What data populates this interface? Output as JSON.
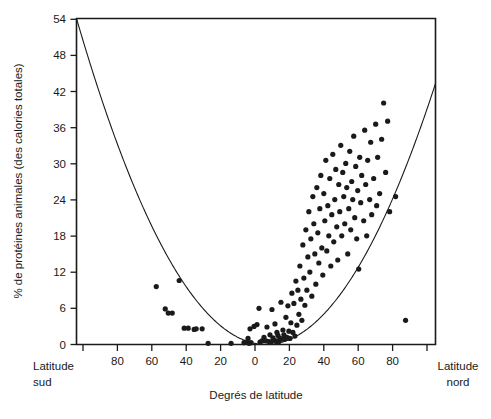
{
  "chart_data": {
    "type": "scatter",
    "title": "",
    "xlabel": "Degrés de latitude",
    "ylabel": "% de protéines animales (des calories totales)",
    "xlim": [
      -90,
      90
    ],
    "ylim": [
      0,
      54
    ],
    "grid": false,
    "legend": null,
    "x_axis": {
      "label": "Degrés de latitude",
      "tick_values": [
        -90,
        -80,
        -60,
        -40,
        -20,
        0,
        20,
        40,
        60,
        80,
        90
      ],
      "tick_labels": [
        "",
        "80",
        "60",
        "40",
        "20",
        "0",
        "20",
        "40",
        "60",
        "80",
        ""
      ],
      "left_corner_label_line1": "Latitude",
      "left_corner_label_line2": "sud",
      "right_corner_label_line1": "Latitude",
      "right_corner_label_line2": "nord",
      "note": "negative x = latitude sud, positive x = latitude nord"
    },
    "y_axis": {
      "label": "% de protéines animales (des calories totales)",
      "tick_values": [
        0,
        6,
        12,
        18,
        24,
        30,
        36,
        42,
        48,
        54
      ],
      "tick_labels": [
        "0",
        "6",
        "12",
        "18",
        "24",
        "30",
        "36",
        "42",
        "48",
        "54"
      ]
    },
    "series": [
      {
        "name": "pays",
        "marker": "filled-circle",
        "color": "#1a1a1a",
        "points": [
          [
            -50.0,
            9.6
          ],
          [
            -45.5,
            5.9
          ],
          [
            -44.0,
            5.2
          ],
          [
            -42.0,
            5.2
          ],
          [
            -38.5,
            10.6
          ],
          [
            -36.0,
            2.7
          ],
          [
            -34.0,
            2.7
          ],
          [
            -31.0,
            2.5
          ],
          [
            -30.0,
            2.6
          ],
          [
            -27.0,
            2.6
          ],
          [
            -24.0,
            0.2
          ],
          [
            -12.5,
            0.2
          ],
          [
            -6.0,
            0.3
          ],
          [
            -4.5,
            0.4
          ],
          [
            -4.0,
            1.0
          ],
          [
            -3.5,
            0.2
          ],
          [
            -3.0,
            2.6
          ],
          [
            -2.5,
            0.3
          ],
          [
            -1.0,
            3.0
          ],
          [
            0.5,
            3.3
          ],
          [
            1.5,
            6.0
          ],
          [
            2.0,
            0.4
          ],
          [
            3.0,
            0.6
          ],
          [
            4.0,
            1.2
          ],
          [
            5.0,
            0.6
          ],
          [
            5.5,
            2.9
          ],
          [
            6.5,
            0.5
          ],
          [
            7.0,
            1.6
          ],
          [
            7.5,
            0.4
          ],
          [
            8.0,
            5.8
          ],
          [
            8.5,
            1.1
          ],
          [
            9.0,
            0.7
          ],
          [
            9.5,
            3.4
          ],
          [
            10.0,
            0.6
          ],
          [
            10.5,
            2.0
          ],
          [
            11.0,
            1.5
          ],
          [
            11.5,
            0.5
          ],
          [
            12.0,
            1.0
          ],
          [
            12.5,
            7.0
          ],
          [
            13.0,
            0.9
          ],
          [
            13.5,
            2.4
          ],
          [
            14.0,
            1.6
          ],
          [
            14.5,
            0.9
          ],
          [
            15.0,
            4.5
          ],
          [
            15.5,
            1.2
          ],
          [
            16.0,
            6.4
          ],
          [
            16.5,
            2.2
          ],
          [
            17.0,
            1.0
          ],
          [
            17.5,
            3.6
          ],
          [
            18.0,
            8.5
          ],
          [
            18.5,
            2.0
          ],
          [
            19.0,
            6.8
          ],
          [
            19.5,
            1.4
          ],
          [
            20.0,
            10.5
          ],
          [
            20.5,
            3.2
          ],
          [
            21.0,
            9.0
          ],
          [
            21.5,
            5.0
          ],
          [
            22.0,
            13.0
          ],
          [
            22.5,
            7.5
          ],
          [
            23.0,
            4.0
          ],
          [
            23.5,
            16.5
          ],
          [
            24.0,
            11.0
          ],
          [
            24.5,
            6.5
          ],
          [
            25.0,
            19.0
          ],
          [
            25.5,
            9.0
          ],
          [
            26.0,
            14.5
          ],
          [
            26.5,
            22.0
          ],
          [
            27.0,
            12.0
          ],
          [
            27.5,
            17.5
          ],
          [
            28.0,
            8.0
          ],
          [
            28.5,
            24.5
          ],
          [
            29.0,
            20.0
          ],
          [
            29.5,
            15.0
          ],
          [
            30.0,
            10.0
          ],
          [
            30.5,
            26.0
          ],
          [
            31.0,
            18.5
          ],
          [
            31.5,
            13.5
          ],
          [
            32.0,
            22.5
          ],
          [
            32.5,
            28.0
          ],
          [
            33.0,
            16.0
          ],
          [
            33.5,
            11.5
          ],
          [
            34.0,
            25.0
          ],
          [
            34.5,
            20.5
          ],
          [
            35.0,
            30.5
          ],
          [
            35.5,
            15.5
          ],
          [
            36.0,
            23.0
          ],
          [
            36.5,
            18.0
          ],
          [
            37.0,
            27.5
          ],
          [
            37.5,
            13.0
          ],
          [
            38.0,
            21.5
          ],
          [
            38.5,
            31.5
          ],
          [
            39.0,
            17.0
          ],
          [
            39.5,
            24.0
          ],
          [
            40.0,
            29.0
          ],
          [
            40.5,
            19.5
          ],
          [
            41.0,
            14.0
          ],
          [
            41.5,
            26.5
          ],
          [
            42.0,
            22.0
          ],
          [
            42.5,
            33.0
          ],
          [
            43.0,
            18.0
          ],
          [
            43.5,
            28.5
          ],
          [
            44.0,
            24.5
          ],
          [
            44.5,
            20.0
          ],
          [
            45.0,
            30.0
          ],
          [
            45.5,
            26.0
          ],
          [
            46.0,
            15.0
          ],
          [
            46.5,
            22.5
          ],
          [
            47.0,
            32.0
          ],
          [
            47.5,
            19.0
          ],
          [
            48.0,
            27.0
          ],
          [
            48.5,
            24.0
          ],
          [
            49.0,
            34.5
          ],
          [
            49.5,
            21.0
          ],
          [
            50.0,
            29.5
          ],
          [
            50.5,
            17.5
          ],
          [
            51.0,
            25.5
          ],
          [
            51.5,
            12.5
          ],
          [
            52.0,
            31.0
          ],
          [
            52.5,
            23.5
          ],
          [
            53.0,
            28.0
          ],
          [
            54.0,
            20.5
          ],
          [
            54.5,
            35.5
          ],
          [
            55.0,
            26.5
          ],
          [
            55.5,
            18.0
          ],
          [
            56.0,
            30.5
          ],
          [
            57.0,
            24.0
          ],
          [
            57.5,
            33.5
          ],
          [
            58.0,
            21.5
          ],
          [
            59.0,
            27.5
          ],
          [
            60.0,
            36.5
          ],
          [
            60.5,
            23.0
          ],
          [
            61.0,
            31.0
          ],
          [
            62.0,
            25.0
          ],
          [
            63.0,
            34.0
          ],
          [
            64.0,
            40.0
          ],
          [
            65.0,
            28.5
          ],
          [
            66.0,
            37.0
          ],
          [
            67.0,
            22.0
          ],
          [
            70.0,
            24.5
          ],
          [
            75.0,
            4.0
          ]
        ]
      }
    ],
    "fitted_curve": {
      "name": "courbe ajustée (parabole)",
      "type": "quadratic",
      "color": "#1a1a1a",
      "description": "courbe en U passant par 54 à 90° sud et ~50 à 90° nord, minimum proche de 0 vers 5° nord"
    }
  }
}
